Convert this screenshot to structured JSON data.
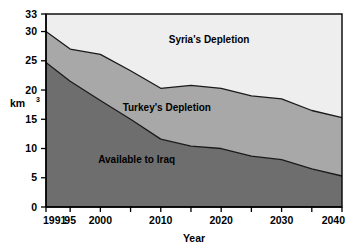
{
  "chart_data": {
    "type": "area",
    "stacked": true,
    "title": "",
    "xlabel": "Year",
    "ylabel": "km3",
    "ylabel_display": "km",
    "ylabel_superscript": "3",
    "xlim": [
      1991,
      2040
    ],
    "ylim": [
      0,
      33
    ],
    "grid": false,
    "legend": "inline-area-labels",
    "y_ticks": [
      0,
      5,
      10,
      15,
      20,
      25,
      30,
      33
    ],
    "y_tick_labels": [
      "0",
      "5",
      "10",
      "15",
      "20",
      "25",
      "30",
      "33"
    ],
    "x_ticks": [
      1991,
      1995,
      2000,
      2005,
      2010,
      2015,
      2020,
      2025,
      2030,
      2035,
      2040
    ],
    "x_tick_labels": [
      "1991",
      "95",
      "2000",
      "",
      "2010",
      "",
      "2020",
      "",
      "2030",
      "",
      "2040"
    ],
    "x": [
      1991,
      1995,
      2000,
      2005,
      2010,
      2015,
      2020,
      2025,
      2030,
      2035,
      2040
    ],
    "series": [
      {
        "name": "Available to Iraq",
        "color": "#6e6e6e",
        "values": [
          24.7,
          21.5,
          18.2,
          15.0,
          11.6,
          10.4,
          10.0,
          8.7,
          8.1,
          6.5,
          5.3
        ]
      },
      {
        "name": "Turkey's Depletion",
        "color": "#a8a8a8",
        "values": [
          5.3,
          5.4,
          7.9,
          8.3,
          8.7,
          10.4,
          10.3,
          10.3,
          10.4,
          10.0,
          10.0
        ]
      },
      {
        "name": "Syria's Depletion",
        "color": "#eeeeee",
        "values": [
          3.0,
          4.1,
          6.9,
          9.7,
          11.7,
          11.2,
          12.7,
          14.0,
          14.5,
          16.5,
          17.7
        ]
      }
    ],
    "cumulative_top": [
      30.0,
      31.0,
      33.0,
      33.0,
      32.0,
      32.0,
      33.0,
      33.0,
      33.0,
      33.0,
      33.0
    ],
    "boundary_lines": {
      "iraq_top": [
        24.7,
        21.5,
        18.2,
        15.0,
        11.6,
        10.4,
        10.0,
        8.7,
        8.1,
        6.5,
        5.3
      ],
      "turkey_top": [
        30.0,
        27.0,
        26.1,
        23.3,
        20.3,
        20.8,
        20.3,
        19.0,
        18.5,
        16.5,
        15.3
      ]
    },
    "annotations": [
      {
        "text": "Syria's Depletion",
        "x": 2018,
        "y": 28.0
      },
      {
        "text": "Turkey's Depletion",
        "x": 2011,
        "y": 16.5
      },
      {
        "text": "Available to Iraq",
        "x": 2006,
        "y": 7.6
      }
    ],
    "colors": {
      "syria": "#eeeeee",
      "turkey": "#a8a8a8",
      "iraq": "#6e6e6e",
      "axis": "#000000",
      "background": "#ffffff"
    }
  }
}
